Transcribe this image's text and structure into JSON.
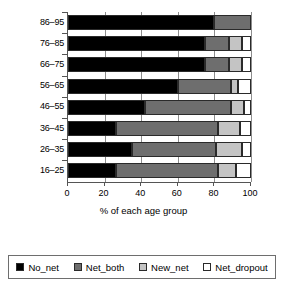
{
  "chart_data": {
    "type": "bar",
    "orientation": "horizontal",
    "stacked": true,
    "stack_mode": "percent",
    "title": "",
    "xlabel": "% of each age group",
    "ylabel": "",
    "xlim": [
      0,
      100
    ],
    "xticks": [
      0,
      20,
      40,
      60,
      80,
      100
    ],
    "xtick_labels": [
      "0",
      "20",
      "40",
      "60",
      "80",
      "100"
    ],
    "grid": true,
    "grid_axis": "x",
    "legend_position": "bottom",
    "categories": [
      "86–95",
      "76–85",
      "66–75",
      "56–65",
      "46–55",
      "36–45",
      "26–35",
      "16–25"
    ],
    "series": [
      {
        "name": "No_net",
        "color": "#000000",
        "values": [
          80,
          75,
          75,
          60,
          42,
          26,
          35,
          26
        ]
      },
      {
        "name": "Net_both",
        "color": "#6e6e6e",
        "values": [
          20,
          13,
          13,
          29,
          47,
          56,
          46,
          56
        ]
      },
      {
        "name": "New_net",
        "color": "#c4c4c4",
        "values": [
          0,
          7,
          7,
          4,
          7,
          12,
          14,
          10
        ]
      },
      {
        "name": "Net_dropout",
        "color": "#ffffff",
        "values": [
          0,
          5,
          5,
          7,
          4,
          6,
          5,
          8
        ]
      }
    ],
    "legend": [
      {
        "label": "No_net",
        "color": "#000000"
      },
      {
        "label": "Net_both",
        "color": "#6e6e6e"
      },
      {
        "label": "New_net",
        "color": "#c4c4c4"
      },
      {
        "label": "Net_dropout",
        "color": "#ffffff"
      }
    ]
  }
}
